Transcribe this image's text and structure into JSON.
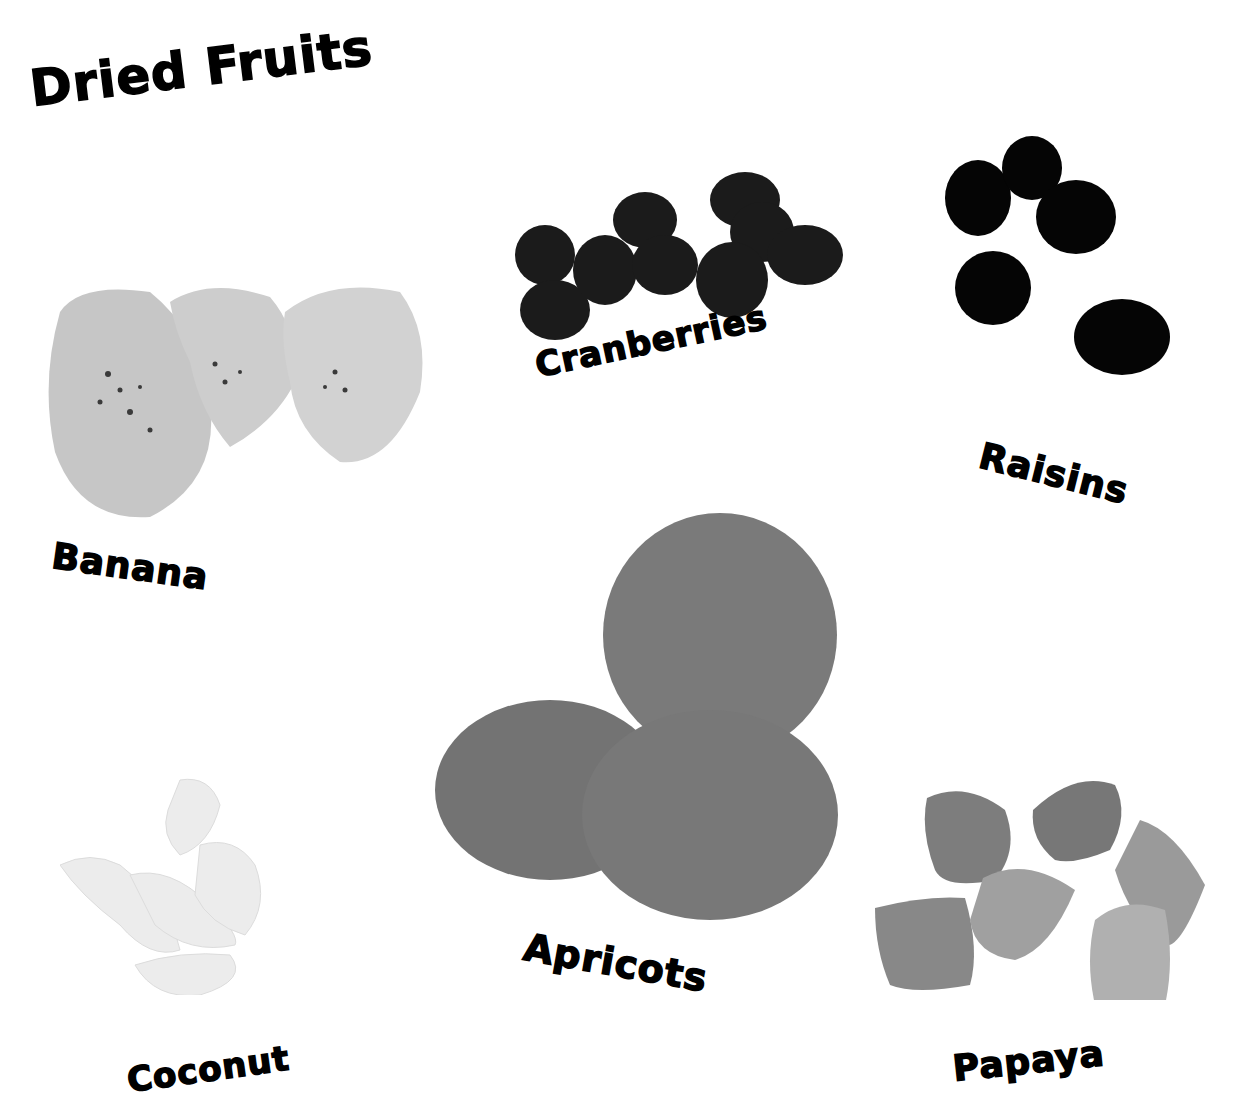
{
  "page": {
    "title": "Dried Fruits",
    "background": "#ffffff"
  },
  "fruits": [
    {
      "name": "Banana",
      "tone": "#c9c9c9"
    },
    {
      "name": "Cranberries",
      "tone": "#1a1a1a"
    },
    {
      "name": "Raisins",
      "tone": "#050505"
    },
    {
      "name": "Apricots",
      "tone": "#7a7a7a"
    },
    {
      "name": "Coconut",
      "tone": "#ebebeb"
    },
    {
      "name": "Papaya",
      "tone": "#8f8f8f"
    }
  ]
}
